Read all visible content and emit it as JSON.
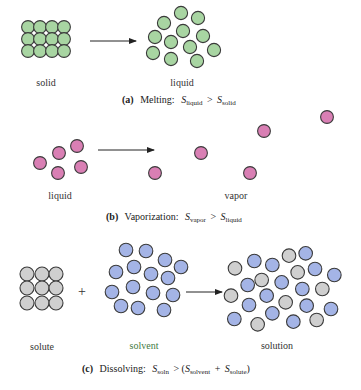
{
  "colors": {
    "solid_liquid_particle": "#a8d5a2",
    "vapor_particle": "#d97fb4",
    "solute_particle": "#cfcfcf",
    "solvent_particle": "#a4b4e6",
    "particle_outline": "#3a3a3a",
    "solvent_label": "#3f7a3f"
  },
  "panel_a": {
    "left_label": "solid",
    "right_label": "liquid",
    "caption_tag": "(a)",
    "caption_title": "Melting:",
    "caption_s1": "S",
    "caption_s1_sub": "liquid",
    "caption_op": ">",
    "caption_s2": "S",
    "caption_s2_sub": "solid"
  },
  "panel_b": {
    "left_label": "liquid",
    "right_label": "vapor",
    "caption_tag": "(b)",
    "caption_title": "Vaporization:",
    "caption_s1": "S",
    "caption_s1_sub": "vapor",
    "caption_op": ">",
    "caption_s2": "S",
    "caption_s2_sub": "liquid"
  },
  "panel_c": {
    "left_label": "solute",
    "plus": "+",
    "middle_label": "solvent",
    "right_label": "solution",
    "caption_tag": "(c)",
    "caption_title": "Dissolving:",
    "caption_s1": "S",
    "caption_s1_sub": "soln",
    "caption_op": "> (",
    "caption_s2": "S",
    "caption_s2_sub": "solvent",
    "caption_plus": "+",
    "caption_s3": "S",
    "caption_s3_sub": "solute",
    "caption_close": ")"
  }
}
